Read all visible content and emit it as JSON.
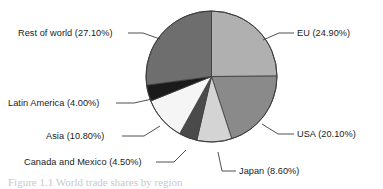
{
  "chart_data": {
    "type": "pie",
    "title": "",
    "labels": [
      "EU",
      "USA",
      "Japan",
      "Canada and Mexico",
      "Asia",
      "Latin America",
      "Rest of world"
    ],
    "values": [
      24.9,
      20.1,
      8.6,
      4.5,
      10.8,
      4.0,
      27.1
    ],
    "unit": "%",
    "legend": "none",
    "grid": false,
    "start_angle_deg": 0,
    "direction": "clockwise",
    "slices": [
      {
        "name": "EU",
        "value": 24.9,
        "label": "EU (24.90%)",
        "color": "#b0b0b0"
      },
      {
        "name": "USA",
        "value": 20.1,
        "label": "USA (20.10%)",
        "color": "#8a8a8a"
      },
      {
        "name": "Japan",
        "value": 8.6,
        "label": "Japan (8.60%)",
        "color": "#d4d4d4"
      },
      {
        "name": "Canada and Mexico",
        "value": 4.5,
        "label": "Canada and Mexico (4.50%)",
        "color": "#4a4a4a"
      },
      {
        "name": "Asia",
        "value": 10.8,
        "label": "Asia (10.80%)",
        "color": "#f5f5f5"
      },
      {
        "name": "Latin America",
        "value": 4.0,
        "label": "Latin America (4.00%)",
        "color": "#1a1a1a"
      },
      {
        "name": "Rest of world",
        "value": 27.1,
        "label": "Rest of world (27.10%)",
        "color": "#6e6e6e"
      }
    ]
  },
  "figure": {
    "background": "#ffffff",
    "outline_color": "#3c3c3c",
    "leader_color": "#3c3c3c",
    "caption_partial": "Figure 1.1  World trade shares by region"
  }
}
